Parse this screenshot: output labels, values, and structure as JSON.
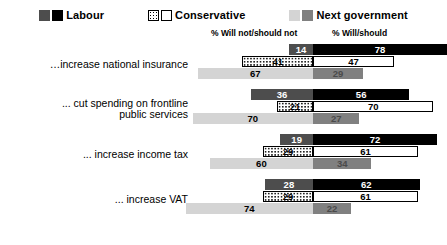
{
  "legend": {
    "items": [
      {
        "label": "Labour",
        "swatch_left": "#4d4d4d",
        "swatch_right": "#000000"
      },
      {
        "label": "Conservative",
        "swatch_left": "#ffffff",
        "swatch_right": "#ffffff"
      },
      {
        "label": "Next government",
        "swatch_left": "#d4d4d4",
        "swatch_right": "#808080"
      }
    ]
  },
  "headers": {
    "left": "% Will not/should not",
    "right": "% Will/should"
  },
  "chart_data": {
    "type": "bar",
    "subtype": "diverging-horizontal-grouped",
    "title": "",
    "xlabel": "",
    "ylabel": "",
    "left_axis_label": "% Will not/should not",
    "right_axis_label": "% Will/should",
    "grid": false,
    "legend_position": "top-center",
    "xlim": [
      0,
      100
    ],
    "categories": [
      "…increase national insurance",
      "... cut spending on frontline\npublic services",
      "... increase income tax",
      "... increase VAT"
    ],
    "series": [
      {
        "name": "Labour",
        "left_values": [
          14,
          36,
          19,
          28
        ],
        "right_values": [
          78,
          56,
          72,
          62
        ]
      },
      {
        "name": "Conservative",
        "left_values": [
          41,
          21,
          29,
          29
        ],
        "right_values": [
          47,
          70,
          61,
          61
        ]
      },
      {
        "name": "Next government",
        "left_values": [
          67,
          70,
          60,
          74
        ],
        "right_values": [
          29,
          27,
          34,
          22
        ]
      }
    ]
  }
}
